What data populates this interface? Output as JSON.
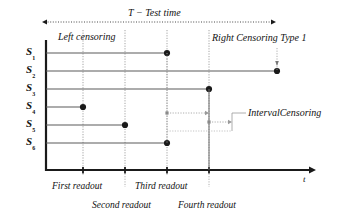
{
  "figure": {
    "type": "censoring-timeline-diagram",
    "background": "#ffffff",
    "ink": "#1a1a1a",
    "grid_color": "#9a9a9a",
    "width": 350,
    "height": 223
  },
  "axes": {
    "x_axis_label": "t",
    "y_axis_label": "",
    "x_axis_y": 170,
    "y_axis_x": 46,
    "x_axis_end": 316,
    "y_axis_top": 40
  },
  "top_span": {
    "label": "T  − Test time",
    "label_x": 128,
    "label_y": 8,
    "arrow_left_x": 42,
    "arrow_right_x": 276,
    "arrow_y": 22,
    "style": "dotted-double-arrow"
  },
  "annotations": [
    {
      "id": "left-censoring",
      "label": "Left censoring",
      "x": 58,
      "y": 32,
      "font_size": 10
    },
    {
      "id": "right-censoring-type1",
      "label": "Right Censoring Type 1",
      "x": 212,
      "y": 33,
      "font_size": 10,
      "pointer": {
        "from_x": 277,
        "from_y": 48,
        "to_x": 277,
        "to_y": 64
      }
    },
    {
      "id": "interval-censoring",
      "label": "IntervalCensoring",
      "x": 248,
      "y": 108,
      "font_size": 10
    }
  ],
  "subjects": [
    {
      "name": "S",
      "index": "1",
      "label_x": 26,
      "y": 53,
      "line_from_x": 46,
      "line_to_x": 167,
      "event_x": 167,
      "event_marker": "filled-circle",
      "marker_size": 5
    },
    {
      "name": "S",
      "index": "2",
      "label_x": 26,
      "y": 71,
      "line_from_x": 46,
      "line_to_x": 277,
      "event_x": 277,
      "event_marker": "filled-circle",
      "marker_size": 5
    },
    {
      "name": "S",
      "index": "3",
      "label_x": 26,
      "y": 89,
      "line_from_x": 46,
      "line_to_x": 209,
      "event_x": 209,
      "event_marker": "filled-circle",
      "marker_size": 5
    },
    {
      "name": "S",
      "index": "4",
      "label_x": 26,
      "y": 107,
      "line_from_x": 46,
      "line_to_x": 83,
      "event_x": 83,
      "event_marker": "filled-circle",
      "marker_size": 5
    },
    {
      "name": "S",
      "index": "5",
      "label_x": 26,
      "y": 125,
      "line_from_x": 46,
      "line_to_x": 125,
      "event_x": 125,
      "event_marker": "filled-circle",
      "marker_size": 5
    },
    {
      "name": "S",
      "index": "6",
      "label_x": 26,
      "y": 143,
      "line_from_x": 46,
      "line_to_x": 167,
      "event_x": 167,
      "event_marker": "filled-circle",
      "marker_size": 5
    }
  ],
  "readouts": [
    {
      "id": "first",
      "label": "First readout",
      "x": 83,
      "label_x": 52,
      "label_y": 182,
      "tick": true
    },
    {
      "id": "second",
      "label": "Second readout",
      "x": 125,
      "label_x": 92,
      "label_y": 201,
      "tick": true
    },
    {
      "id": "third",
      "label": "Third readout",
      "x": 167,
      "label_x": 135,
      "label_y": 182,
      "tick": true
    },
    {
      "id": "fourth",
      "label": "Fourth readout",
      "x": 209,
      "label_x": 178,
      "label_y": 201,
      "tick": true
    }
  ],
  "interval_brackets": [
    {
      "id": "interval-upper",
      "from_x": 167,
      "to_x": 209,
      "y": 113
    },
    {
      "id": "interval-lower",
      "from_x": 209,
      "to_x": 232,
      "y": 122
    }
  ],
  "interval_connector": {
    "x": 232,
    "from_y": 113,
    "to_y": 131,
    "to_label_x": 246,
    "label_y": 113
  },
  "chart_data": {
    "type": "timeline",
    "title": "T  − Test time",
    "xlabel": "t",
    "ylabel": "",
    "categories": [
      "S1",
      "S2",
      "S3",
      "S4",
      "S5",
      "S6"
    ],
    "readout_times": [
      "First readout",
      "Second readout",
      "Third readout",
      "Fourth readout"
    ],
    "series": [
      {
        "name": "Event time (pixels on t-axis)",
        "values": [
          167,
          277,
          209,
          83,
          125,
          167
        ]
      }
    ],
    "censoring_types": [
      "Left censoring",
      "Right Censoring Type 1",
      "IntervalCensoring"
    ]
  }
}
